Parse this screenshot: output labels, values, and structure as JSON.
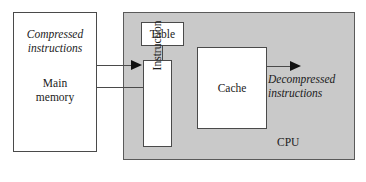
{
  "diagram": {
    "colors": {
      "cpu_fill": "#c9c9c9",
      "box_fill": "#ffffff",
      "stroke": "#4a4a4a",
      "arrow": "#111111",
      "text": "#1b1b1b",
      "page_background": "#ffffff"
    },
    "memory": {
      "compressed_label_line1": "Compressed",
      "compressed_label_line2": "instructions",
      "main_label_line1": "Main",
      "main_label_line2": "memory"
    },
    "cpu": {
      "label": "CPU",
      "table_label": "Table",
      "instruction_label": "Instruction",
      "cache_label": "Cache"
    },
    "output": {
      "label_line1": "Decompressed",
      "label_line2": "instructions"
    },
    "arrows": [
      {
        "name": "memory-to-instruction",
        "has_head": true,
        "direction": "right"
      },
      {
        "name": "instruction-to-memory",
        "has_head": false,
        "direction": "left"
      },
      {
        "name": "cache-to-output",
        "has_head": true,
        "direction": "right"
      }
    ]
  }
}
